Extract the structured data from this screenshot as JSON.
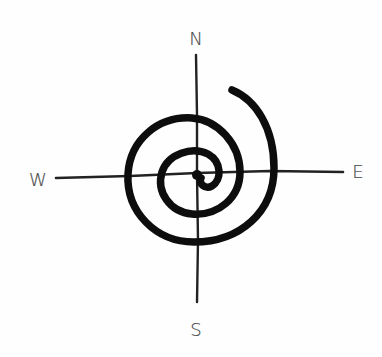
{
  "diagram": {
    "type": "compass-spiral",
    "compass": {
      "north": "N",
      "south": "S",
      "east": "E",
      "west": "W"
    },
    "colors": {
      "ink": "#111111",
      "label": "#444444",
      "background": "#fefefe"
    }
  }
}
